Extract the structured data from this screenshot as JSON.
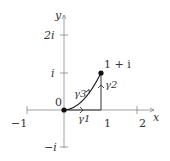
{
  "diagram": {
    "axes": {
      "x_label": "x",
      "y_label": "y",
      "x_ticks": [
        "−1",
        "1",
        "2"
      ],
      "y_ticks": [
        "2i",
        "i",
        "−i"
      ],
      "origin_label": "0"
    },
    "points": {
      "origin": "0",
      "end": "1 + i"
    },
    "paths": {
      "gamma1": "γ1",
      "gamma2": "γ2",
      "gamma3": "γ3"
    },
    "colors": {
      "axis": "#777777",
      "path": "#222222",
      "text": "#333333"
    }
  }
}
